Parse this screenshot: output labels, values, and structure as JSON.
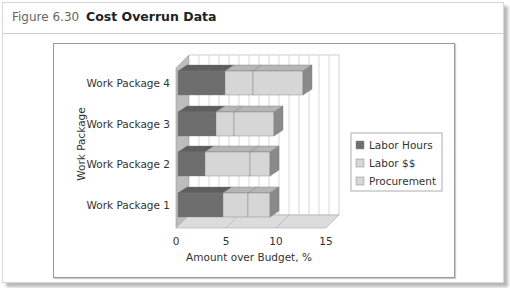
{
  "figure": {
    "number": "Figure 6.30",
    "title": "Cost Overrun Data"
  },
  "colors": {
    "labor_hours": "#6e6e6e",
    "labor_dollars": "#d6d6d6",
    "procurement": "#d6d6d6",
    "grid": "#c8c8c8",
    "wall": "#ffffff",
    "floor": "#dcdcdc"
  },
  "chart_data": {
    "type": "bar",
    "orientation": "horizontal",
    "stacked": true,
    "style": "3d",
    "title": "Cost Overrun Data",
    "xlabel": "Amount over Budget, %",
    "ylabel": "Work Package",
    "categories": [
      "Work Package 1",
      "Work Package 2",
      "Work Package 3",
      "Work Package 4"
    ],
    "series": [
      {
        "name": "Labor Hours",
        "values": [
          4.5,
          2.7,
          3.8,
          4.7
        ]
      },
      {
        "name": "Labor $$",
        "values": [
          2.5,
          4.5,
          1.8,
          2.8
        ]
      },
      {
        "name": "Procurement",
        "values": [
          2.2,
          2.0,
          4.0,
          5.0
        ]
      }
    ],
    "xlim": [
      0,
      15
    ],
    "xticks": [
      "0",
      "5",
      "10",
      "15"
    ],
    "grid": true,
    "legend_position": "right"
  }
}
